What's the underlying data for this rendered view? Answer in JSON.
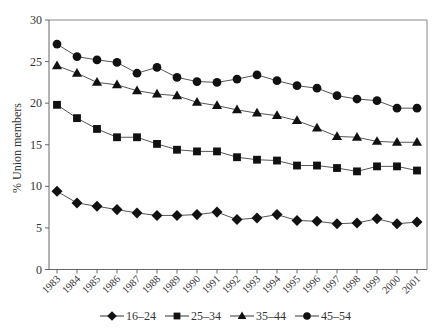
{
  "chart_data": {
    "type": "line",
    "title": "",
    "xlabel": "",
    "ylabel": "% Union members",
    "ylim": [
      0,
      30
    ],
    "yticks": [
      0,
      5,
      10,
      15,
      20,
      25,
      30
    ],
    "grid": false,
    "legend_position": "bottom",
    "categories": [
      "1983",
      "1984",
      "1985",
      "1986",
      "1987",
      "1988",
      "1989",
      "1990",
      "1991",
      "1992",
      "1993",
      "1994",
      "1995",
      "1996",
      "1997",
      "1998",
      "1999",
      "2000",
      "2001"
    ],
    "series": [
      {
        "name": "16–24",
        "marker": "diamond",
        "values": [
          9.4,
          8.0,
          7.6,
          7.2,
          6.8,
          6.5,
          6.5,
          6.6,
          6.9,
          6.0,
          6.2,
          6.6,
          5.9,
          5.8,
          5.5,
          5.6,
          6.1,
          5.5,
          5.7
        ]
      },
      {
        "name": "25–34",
        "marker": "square",
        "values": [
          19.8,
          18.2,
          16.9,
          15.9,
          15.9,
          15.1,
          14.4,
          14.2,
          14.2,
          13.5,
          13.2,
          13.1,
          12.5,
          12.5,
          12.2,
          11.8,
          12.4,
          12.4,
          11.9
        ]
      },
      {
        "name": "35–44",
        "marker": "triangle",
        "values": [
          24.5,
          23.6,
          22.5,
          22.2,
          21.5,
          21.1,
          20.9,
          20.1,
          19.7,
          19.2,
          18.8,
          18.5,
          17.9,
          17.0,
          16.0,
          15.9,
          15.4,
          15.3,
          15.3
        ]
      },
      {
        "name": "45–54",
        "marker": "circle",
        "values": [
          27.1,
          25.6,
          25.2,
          24.9,
          23.6,
          24.3,
          23.1,
          22.6,
          22.5,
          22.9,
          23.4,
          22.7,
          22.1,
          21.8,
          20.9,
          20.5,
          20.3,
          19.4,
          19.4
        ]
      }
    ]
  },
  "colors": {
    "line": "#555555",
    "marker": "#111111",
    "axis": "#666666",
    "frame": "#888888"
  }
}
